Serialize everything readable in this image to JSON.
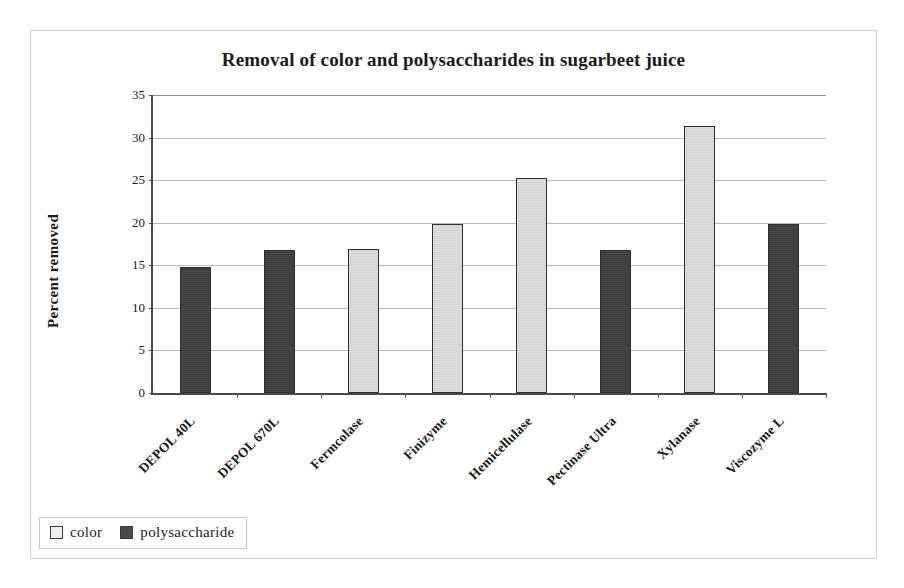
{
  "chart_data": {
    "type": "bar",
    "title": "Removal of color and polysaccharides in sugarbeet juice",
    "xlabel": "",
    "ylabel": "Percent removed",
    "ylim": [
      0,
      35
    ],
    "ytick_step": 5,
    "yticks": [
      "0",
      "5",
      "10",
      "15",
      "20",
      "25",
      "30",
      "35"
    ],
    "grid": true,
    "legend_position": "bottom-left",
    "categories": [
      "DEPOL 40L",
      "DEPOL 670L",
      "Fermcolase",
      "Finizyme",
      "Hemicellulase",
      "Pectinase Ultra",
      "Xylanase",
      "Viscozyme L"
    ],
    "series": [
      {
        "name": "color",
        "color": "#dcdcdc",
        "values": [
          null,
          null,
          16.9,
          19.8,
          25.2,
          null,
          31.4,
          null
        ]
      },
      {
        "name": "polysaccharide",
        "color": "#3f3f3f",
        "values": [
          14.8,
          16.8,
          null,
          null,
          null,
          16.8,
          null,
          19.9
        ]
      }
    ],
    "bars": [
      {
        "category": "DEPOL 40L",
        "series": "polysaccharide",
        "value": 14.8
      },
      {
        "category": "DEPOL 670L",
        "series": "polysaccharide",
        "value": 16.8
      },
      {
        "category": "Fermcolase",
        "series": "color",
        "value": 16.9
      },
      {
        "category": "Finizyme",
        "series": "color",
        "value": 19.8
      },
      {
        "category": "Hemicellulase",
        "series": "color",
        "value": 25.2
      },
      {
        "category": "Pectinase Ultra",
        "series": "polysaccharide",
        "value": 16.8
      },
      {
        "category": "Xylanase",
        "series": "color",
        "value": 31.4
      },
      {
        "category": "Viscozyme L",
        "series": "polysaccharide",
        "value": 19.9
      }
    ]
  },
  "legend": {
    "entries": [
      {
        "label": "color",
        "swatch": "light-square-swatch"
      },
      {
        "label": "polysaccharide",
        "swatch": "dark-square-swatch"
      }
    ]
  }
}
